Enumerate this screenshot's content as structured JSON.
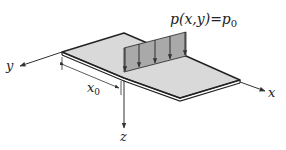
{
  "diagram": {
    "load_label": {
      "base": "p(x,y)=p",
      "subscript": "0"
    },
    "axes": {
      "x": "x",
      "y": "y",
      "z": "z"
    },
    "dimension": {
      "base": "x",
      "subscript": "0"
    },
    "colors": {
      "plate_fill": "#d9d9d9",
      "load_fill": "#a9a9a9",
      "stroke": "#222222"
    },
    "load_arrow_count": 5
  }
}
